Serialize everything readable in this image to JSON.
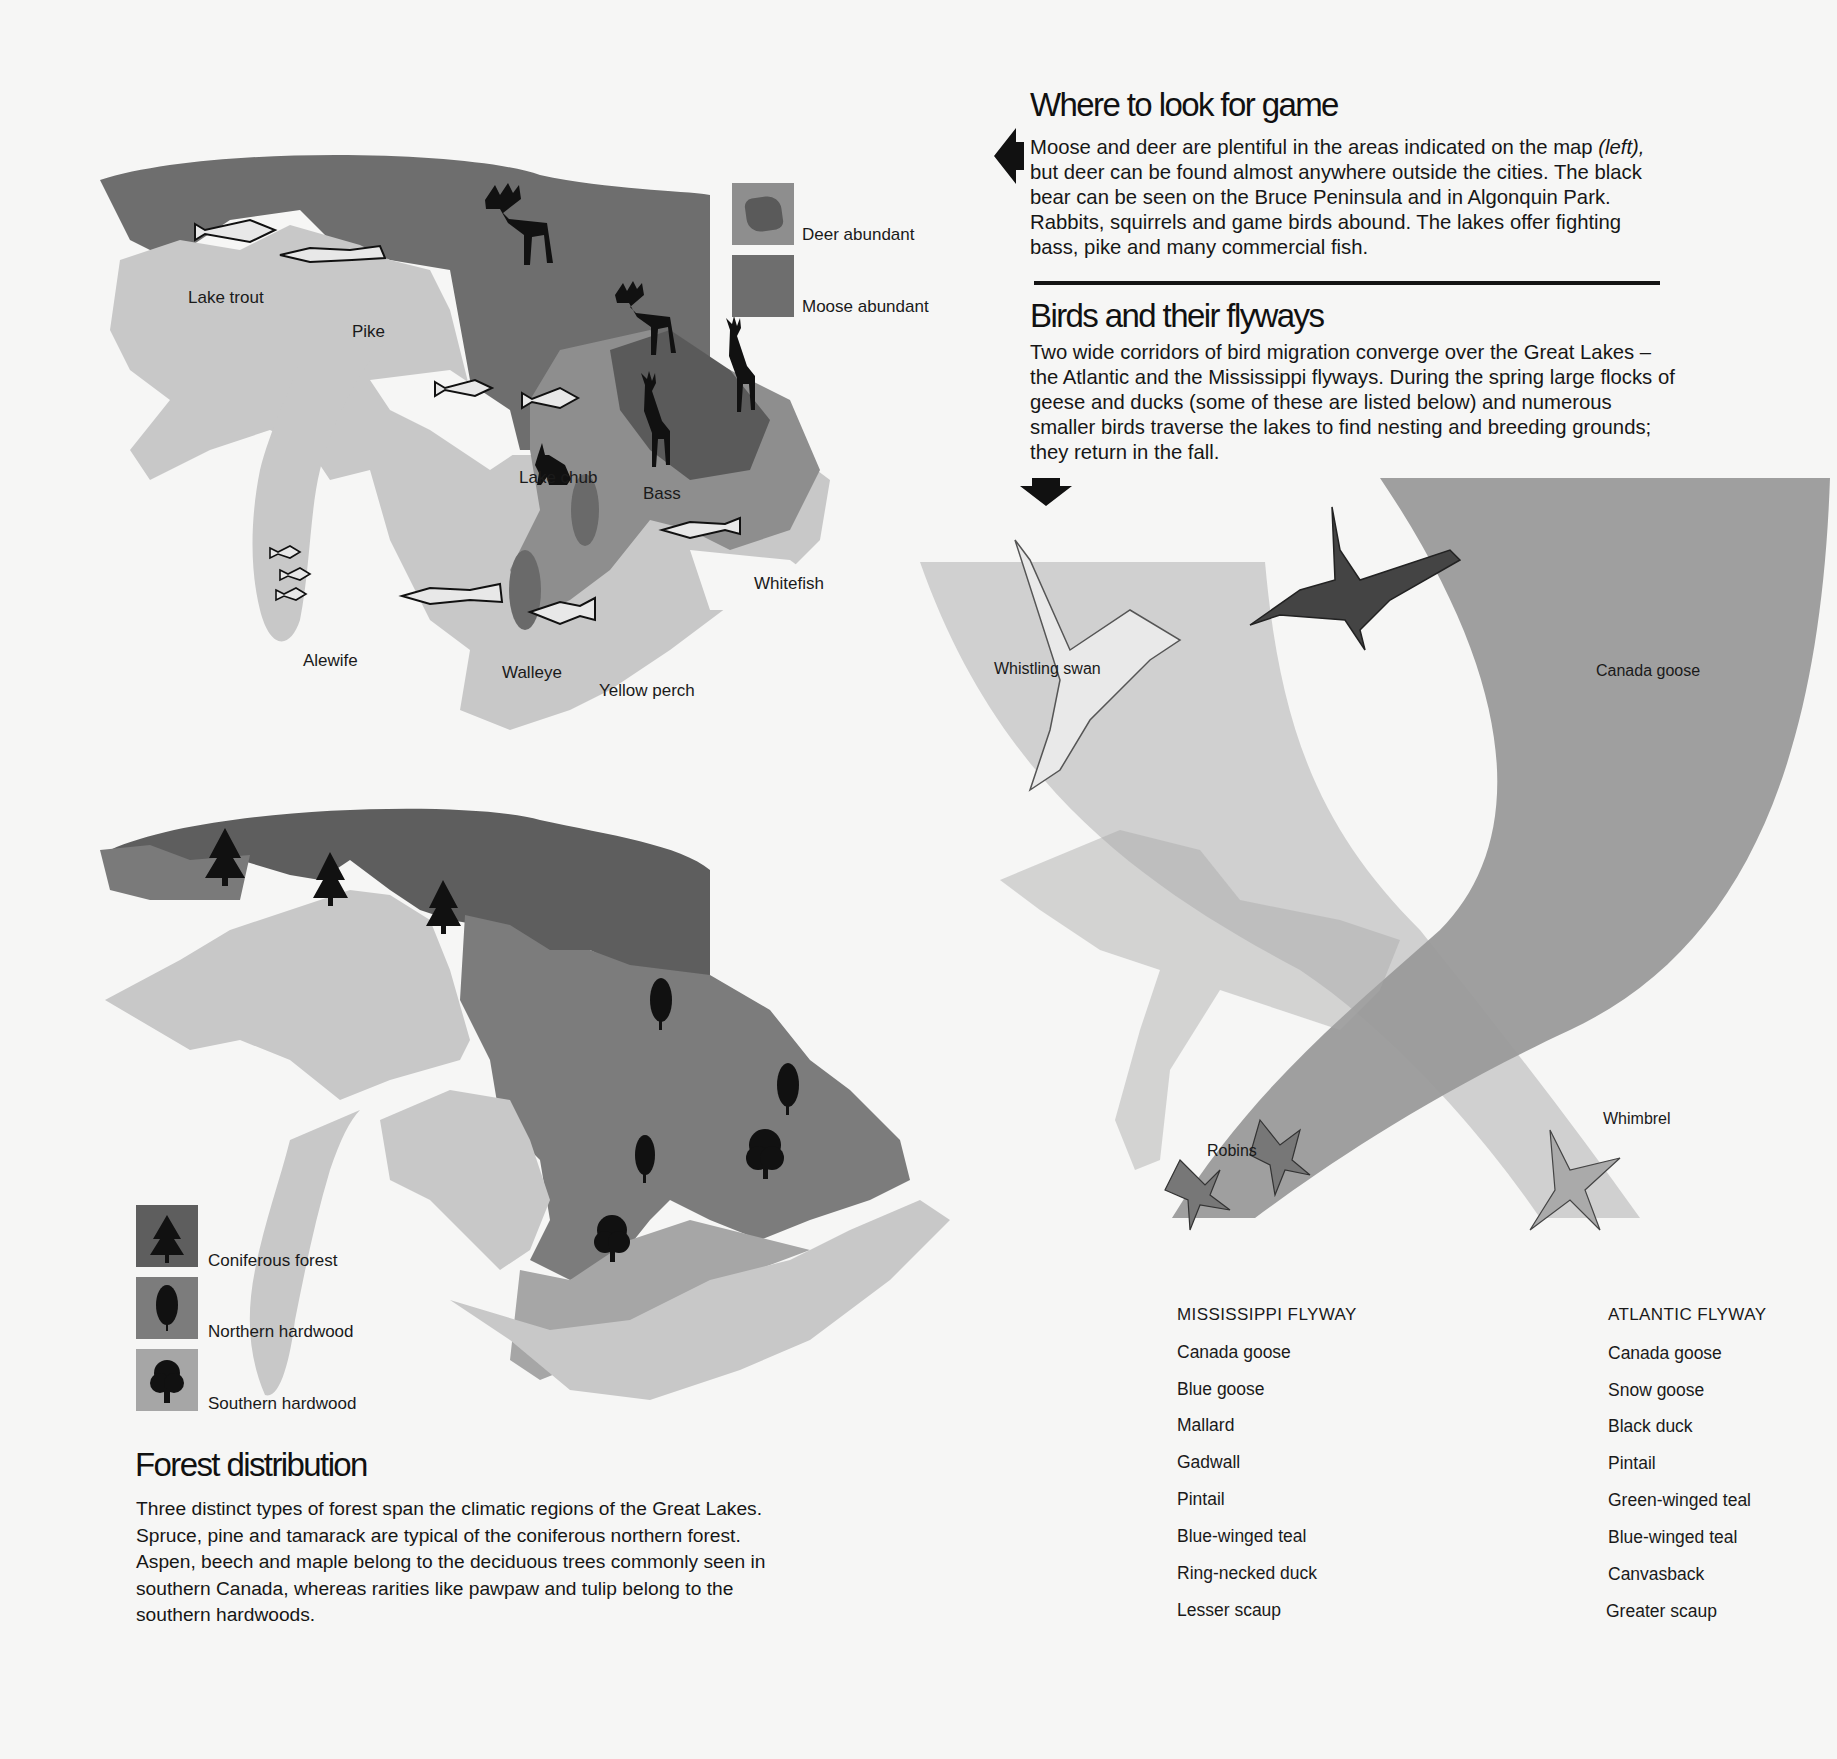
{
  "colors": {
    "background": "#f6f6f5",
    "land_light": "#c8c8c8",
    "land_mid": "#8e8e8e",
    "land_dark": "#6e6e6e",
    "land_darkest": "#5a5a5a",
    "flyway_light": "#cdcdcd",
    "flyway_dark": "#9a9a9a",
    "text": "#111111"
  },
  "game_section": {
    "title": "Where to look for game",
    "paragraph_1": "Moose and deer are plentiful in the areas indicated on the map ",
    "paragraph_italic": "(left),",
    "paragraph_2": " but deer can be found almost anywhere outside the cities. The black bear can be seen on the Bruce Peninsula and in Algonquin Park. Rabbits, squirrels and game birds abound. The lakes offer fighting bass, pike and many commercial fish.",
    "arrow_icon": "left-arrow"
  },
  "birds_section": {
    "title": "Birds and their flyways",
    "paragraph": "Two wide corridors of bird migration converge over the Great Lakes – the Atlantic and the Mississippi flyways. During the spring large flocks of geese and ducks (some of these are listed below) and numerous smaller birds traverse the lakes to find nesting and breeding grounds; they return in the fall.",
    "arrow_icon": "down-arrow"
  },
  "game_map": {
    "legend": [
      {
        "label": "Deer abundant",
        "icon": "deer-area-swatch"
      },
      {
        "label": "Moose abundant",
        "icon": "moose-area-swatch"
      }
    ],
    "fish_labels": {
      "lake_trout": "Lake trout",
      "pike": "Pike",
      "lake_chub": "Lake chub",
      "bass": "Bass",
      "whitefish": "Whitefish",
      "alewife": "Alewife",
      "walleye": "Walleye",
      "yellow_perch": "Yellow perch"
    },
    "animal_icons": [
      "moose-icon",
      "moose-icon",
      "deer-icon",
      "deer-icon",
      "rabbit-icon"
    ]
  },
  "forest_map": {
    "legend": [
      {
        "label": "Coniferous forest",
        "icon": "conifer-tree-icon"
      },
      {
        "label": "Northern hardwood",
        "icon": "northern-hardwood-tree-icon"
      },
      {
        "label": "Southern hardwood",
        "icon": "southern-hardwood-tree-icon"
      }
    ]
  },
  "forest_section": {
    "title": "Forest distribution",
    "paragraph": "Three distinct types of forest span the climatic regions of the Great Lakes. Spruce, pine and tamarack are typical of the coniferous northern forest. Aspen, beech and maple belong to the deciduous trees commonly seen in southern Canada, whereas rarities like pawpaw and tulip belong to the southern hardwoods."
  },
  "flyway_map": {
    "bird_labels": {
      "whistling_swan": "Whistling swan",
      "canada_goose": "Canada goose",
      "robins": "Robins",
      "whimbrel": "Whimbrel"
    }
  },
  "flyway_lists": {
    "mississippi": {
      "title": "MISSISSIPPI FLYWAY",
      "items": [
        "Canada goose",
        "Blue goose",
        "Mallard",
        "Gadwall",
        "Pintail",
        "Blue-winged teal",
        "Ring-necked duck",
        "Lesser scaup"
      ]
    },
    "atlantic": {
      "title": "ATLANTIC FLYWAY",
      "items": [
        "Canada goose",
        "Snow goose",
        "Black duck",
        "Pintail",
        "Green-winged teal",
        "Blue-winged teal",
        "Canvasback",
        "Greater scaup"
      ]
    }
  }
}
